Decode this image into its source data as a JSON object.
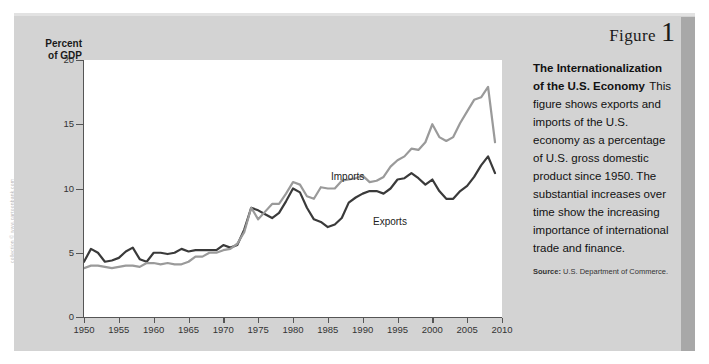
{
  "watermark": "collection © www.cartoonbank.com",
  "figure": {
    "label": "Figure",
    "number": "1",
    "title": "The Internationalization of the U.S. Economy",
    "body": "This figure shows exports and imports of the U.S. economy as a percentage of U.S. gross domestic product since 1950. The substantial increases over time show the increasing importance of international trade and finance.",
    "source_label": "Source:",
    "source_text": "U.S. Department of Commerce."
  },
  "colors": {
    "panel": "#d3d3d3",
    "panel_shadow": "#a8a8a8",
    "plot_bg": "#ffffff",
    "axis": "#555555",
    "imports_line": "#9a9a9a",
    "exports_line": "#3a3a3a"
  },
  "chart_data": {
    "type": "line",
    "title": "",
    "xlabel": "",
    "ylabel": "Percent of GDP",
    "ylabel_line1": "Percent",
    "ylabel_line2": "of GDP",
    "xlim": [
      1950,
      2010
    ],
    "ylim": [
      0,
      20
    ],
    "yticks": [
      0,
      5,
      10,
      15,
      20
    ],
    "ytick_labels": [
      "0",
      "5",
      "10",
      "15",
      "20"
    ],
    "xticks": [
      1950,
      1955,
      1960,
      1965,
      1970,
      1975,
      1980,
      1985,
      1990,
      1995,
      2000,
      2005,
      2010
    ],
    "xtick_labels": [
      "1950",
      "1955",
      "1960",
      "1965",
      "1970",
      "1975",
      "1980",
      "1985",
      "1990",
      "1995",
      "2000",
      "2005",
      "2010"
    ],
    "grid": false,
    "legend_position": "inline-annotation",
    "annotations": [
      {
        "text": "Imports",
        "x": 1991,
        "y": 12.1
      },
      {
        "text": "Exports",
        "x": 1997,
        "y": 8.6
      }
    ],
    "x": [
      1950,
      1951,
      1952,
      1953,
      1954,
      1955,
      1956,
      1957,
      1958,
      1959,
      1960,
      1961,
      1962,
      1963,
      1964,
      1965,
      1966,
      1967,
      1968,
      1969,
      1970,
      1971,
      1972,
      1973,
      1974,
      1975,
      1976,
      1977,
      1978,
      1979,
      1980,
      1981,
      1982,
      1983,
      1984,
      1985,
      1986,
      1987,
      1988,
      1989,
      1990,
      1991,
      1992,
      1993,
      1994,
      1995,
      1996,
      1997,
      1998,
      1999,
      2000,
      2001,
      2002,
      2003,
      2004,
      2005,
      2006,
      2007,
      2008,
      2009
    ],
    "series": [
      {
        "name": "Exports",
        "color": "#3a3a3a",
        "values": [
          4.3,
          5.3,
          5.0,
          4.3,
          4.4,
          4.6,
          5.1,
          5.4,
          4.5,
          4.3,
          5.0,
          5.0,
          4.9,
          5.0,
          5.3,
          5.1,
          5.2,
          5.2,
          5.2,
          5.2,
          5.6,
          5.4,
          5.6,
          6.8,
          8.5,
          8.3,
          8.0,
          7.7,
          8.1,
          9.0,
          10.0,
          9.7,
          8.5,
          7.6,
          7.4,
          7.0,
          7.2,
          7.7,
          8.9,
          9.3,
          9.6,
          9.8,
          9.8,
          9.6,
          10.0,
          10.7,
          10.8,
          11.2,
          10.8,
          10.3,
          10.7,
          9.8,
          9.2,
          9.2,
          9.8,
          10.2,
          10.9,
          11.8,
          12.5,
          11.2
        ]
      },
      {
        "name": "Imports",
        "color": "#9a9a9a",
        "values": [
          3.8,
          4.0,
          4.0,
          3.9,
          3.8,
          3.9,
          4.0,
          4.0,
          3.9,
          4.2,
          4.2,
          4.1,
          4.2,
          4.1,
          4.1,
          4.3,
          4.7,
          4.7,
          5.0,
          5.0,
          5.2,
          5.3,
          5.7,
          6.6,
          8.5,
          7.6,
          8.2,
          8.8,
          8.8,
          9.6,
          10.5,
          10.3,
          9.4,
          9.2,
          10.1,
          10.0,
          10.0,
          10.6,
          10.7,
          10.8,
          11.0,
          10.5,
          10.6,
          10.9,
          11.7,
          12.2,
          12.5,
          13.1,
          13.0,
          13.6,
          15.0,
          14.0,
          13.7,
          14.0,
          15.1,
          16.0,
          16.9,
          17.1,
          17.9,
          13.6
        ]
      }
    ]
  }
}
